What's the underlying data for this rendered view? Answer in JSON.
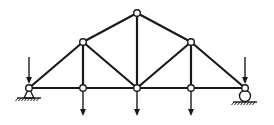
{
  "diagram": {
    "type": "pratt-roof-truss",
    "colors": {
      "line": "#1a1a1a",
      "background": "#ffffff",
      "node_fill": "#ffffff"
    },
    "nodes": [
      {
        "id": "L0",
        "x": 29,
        "y": 88
      },
      {
        "id": "L1",
        "x": 83,
        "y": 88
      },
      {
        "id": "L2",
        "x": 137,
        "y": 88
      },
      {
        "id": "L3",
        "x": 191,
        "y": 88
      },
      {
        "id": "L4",
        "x": 245,
        "y": 88
      },
      {
        "id": "U1",
        "x": 83,
        "y": 42
      },
      {
        "id": "U2",
        "x": 137,
        "y": 13
      },
      {
        "id": "U3",
        "x": 191,
        "y": 42
      }
    ],
    "members": [
      [
        "L0",
        "L1"
      ],
      [
        "L1",
        "L2"
      ],
      [
        "L2",
        "L3"
      ],
      [
        "L3",
        "L4"
      ],
      [
        "L0",
        "U1"
      ],
      [
        "U1",
        "U2"
      ],
      [
        "U2",
        "U3"
      ],
      [
        "U3",
        "L4"
      ],
      [
        "U1",
        "L1"
      ],
      [
        "U2",
        "L2"
      ],
      [
        "U3",
        "L3"
      ],
      [
        "U1",
        "L2"
      ],
      [
        "U3",
        "L2"
      ]
    ],
    "supports": [
      {
        "node": "L0",
        "kind": "pin"
      },
      {
        "node": "L4",
        "kind": "roller"
      }
    ],
    "loads": [
      {
        "node": "L0",
        "direction": "down",
        "position": "above"
      },
      {
        "node": "L4",
        "direction": "down",
        "position": "above"
      },
      {
        "node": "L1",
        "direction": "down",
        "position": "below"
      },
      {
        "node": "L2",
        "direction": "down",
        "position": "below"
      },
      {
        "node": "L3",
        "direction": "down",
        "position": "below"
      }
    ]
  }
}
